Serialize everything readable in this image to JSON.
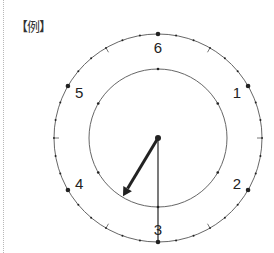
{
  "label": "【例】",
  "dial": {
    "type": "six-hour clock face",
    "numbers": [
      {
        "text": "6",
        "angle_deg": 0
      },
      {
        "text": "1",
        "angle_deg": 60
      },
      {
        "text": "2",
        "angle_deg": 120
      },
      {
        "text": "3",
        "angle_deg": 180
      },
      {
        "text": "4",
        "angle_deg": 240
      },
      {
        "text": "5",
        "angle_deg": 300
      }
    ],
    "minor_dots_per_segment": 5,
    "half_segment_line_ticks": true
  },
  "hands": {
    "hour_hand_angle_deg": 211,
    "minute_hand_angle_deg": 180
  },
  "colors": {
    "line": "#555555",
    "hand": "#222222",
    "dot": "#222222"
  }
}
